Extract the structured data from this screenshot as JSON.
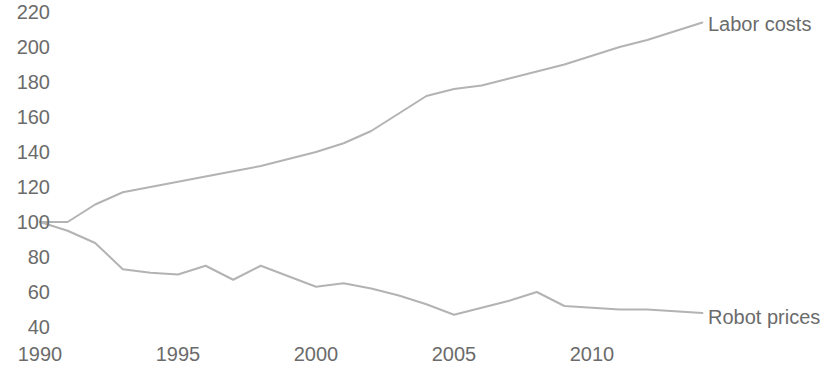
{
  "chart_data": {
    "type": "line",
    "title": "",
    "subtitle": "",
    "xlabel": "",
    "ylabel": "",
    "xlim": [
      1990,
      2014
    ],
    "ylim": [
      33,
      228
    ],
    "grid": false,
    "legend_position": "right-inline",
    "x_tick_labels": [
      "1990",
      "1995",
      "2000",
      "2005",
      "2010"
    ],
    "x_ticks": [
      1990,
      1995,
      2000,
      2005,
      2010
    ],
    "y_tick_labels": [
      "220",
      "200",
      "180",
      "160",
      "140",
      "120",
      "100",
      "80",
      "60",
      "40"
    ],
    "y_ticks": [
      220,
      200,
      180,
      160,
      140,
      120,
      100,
      80,
      60,
      40
    ],
    "note": "Index, 1990 = 100",
    "series": [
      {
        "name": "Labor costs",
        "color": "#b3b3b3",
        "x": [
          1990,
          1991,
          1992,
          1993,
          1994,
          1995,
          1996,
          1997,
          1998,
          1999,
          2000,
          2001,
          2002,
          2003,
          2004,
          2005,
          2006,
          2007,
          2008,
          2009,
          2010,
          2011,
          2012,
          2013,
          2014
        ],
        "values": [
          100,
          100,
          110,
          117,
          120,
          123,
          126,
          129,
          132,
          136,
          140,
          145,
          152,
          162,
          172,
          176,
          178,
          182,
          186,
          190,
          195,
          200,
          204,
          209,
          214
        ]
      },
      {
        "name": "Robot prices",
        "color": "#b3b3b3",
        "x": [
          1990,
          1991,
          1992,
          1993,
          1994,
          1995,
          1996,
          1997,
          1998,
          1999,
          2000,
          2001,
          2002,
          2003,
          2004,
          2005,
          2006,
          2007,
          2008,
          2009,
          2010,
          2011,
          2012,
          2013,
          2014
        ],
        "values": [
          100,
          95,
          88,
          73,
          71,
          70,
          75,
          67,
          75,
          69,
          63,
          65,
          62,
          58,
          53,
          47,
          51,
          55,
          60,
          52,
          51,
          50,
          50,
          49,
          48
        ]
      }
    ],
    "series_labels": [
      {
        "text": "Labor costs",
        "x_px": 708,
        "y_px": 14
      },
      {
        "text": "Robot prices",
        "x_px": 708,
        "y_px": 307
      }
    ],
    "colors": {
      "line": "#b3b3b3",
      "text": "#6b6b6b",
      "background": "#ffffff"
    }
  },
  "axes_geometry": {
    "x_pixel_1990": 40,
    "x_pixel_per_year": 27.6,
    "y_pixel_100": 222,
    "y_pixel_per_unit": 1.75,
    "plot_left": 48,
    "plot_right": 700
  }
}
